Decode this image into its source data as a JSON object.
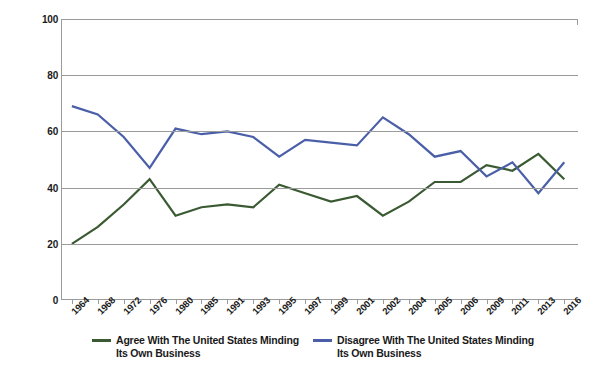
{
  "chart_data": {
    "type": "line",
    "title": "",
    "xlabel": "",
    "ylabel": "% of Americans That Agree or Disagree",
    "ylim": [
      0,
      100
    ],
    "yticks": [
      0,
      20,
      40,
      60,
      80,
      100
    ],
    "grid": true,
    "legend_position": "bottom",
    "categories": [
      "1964",
      "1968",
      "1972",
      "1976",
      "1980",
      "1985",
      "1991",
      "1993",
      "1995",
      "1997",
      "1999",
      "2001",
      "2002",
      "2004",
      "2005",
      "2006",
      "2009",
      "2011",
      "2013",
      "2016"
    ],
    "series": [
      {
        "name": "Agree With The United States Minding\nIts Own Business",
        "color": "#3a5a32",
        "values": [
          20,
          26,
          34,
          43,
          30,
          33,
          34,
          33,
          41,
          38,
          35,
          37,
          30,
          35,
          42,
          42,
          48,
          46,
          52,
          43
        ]
      },
      {
        "name": "Disagree With The United States Minding\nIts Own Business",
        "color": "#4a5fa8",
        "values": [
          69,
          66,
          58,
          47,
          61,
          59,
          60,
          58,
          51,
          57,
          56,
          55,
          65,
          59,
          51,
          53,
          44,
          49,
          38,
          49
        ]
      }
    ]
  },
  "yaxis": {
    "title": "% of Americans That Agree or Disagree",
    "ticks": [
      "100",
      "80",
      "60",
      "40",
      "20",
      "0"
    ]
  },
  "legend": {
    "items": [
      {
        "label": "Agree With The United States Minding\nIts Own Business",
        "color": "#3a5a32"
      },
      {
        "label": "Disagree With The United States Minding\nIts Own Business",
        "color": "#4a5fa8"
      }
    ]
  }
}
